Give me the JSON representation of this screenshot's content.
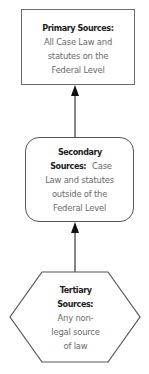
{
  "diagram": {
    "type": "hierarchy-flow",
    "nodes": [
      {
        "id": "primary",
        "shape": "rectangle",
        "title": "Primary Sources:",
        "body_lines": [
          "All Case Law and",
          "statutes on the",
          "Federal Level"
        ]
      },
      {
        "id": "secondary",
        "shape": "rounded-rectangle",
        "title_line1": "Secondary",
        "title_line2": "Sources:",
        "title_line2_suffix": " Case",
        "body_lines": [
          "Law and statutes",
          "outside of the",
          "Federal Level"
        ]
      },
      {
        "id": "tertiary",
        "shape": "hexagon",
        "title_line1": "Tertiary",
        "title_line2": "Sources:",
        "body_lines": [
          "Any non-",
          "legal source",
          "of law"
        ]
      }
    ],
    "edges": [
      {
        "from": "secondary",
        "to": "primary",
        "arrow": "end"
      },
      {
        "from": "tertiary",
        "to": "secondary",
        "arrow": "end"
      }
    ],
    "colors": {
      "stroke": "#555555",
      "title_text": "#222222",
      "body_text": "#6a6a6a",
      "background": "#ffffff"
    }
  }
}
